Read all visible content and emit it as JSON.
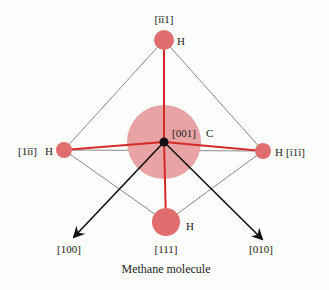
{
  "title": "Methane molecule",
  "colors": {
    "carbon_fill": "#e8a4a4",
    "hydrogen_fill": "#e06e6e",
    "bond": "#d42a2a",
    "axis": "#111111",
    "outline": "#888888"
  },
  "atoms": {
    "carbon": {
      "symbol": "C",
      "direction": "[001]"
    },
    "h_top": {
      "symbol": "H",
      "direction": "[īī1]"
    },
    "h_left": {
      "symbol": "H",
      "direction": "[1īī]"
    },
    "h_right": {
      "symbol": "H",
      "direction": "[ī1ī]"
    },
    "h_bottom": {
      "symbol": "H",
      "direction": "[111]"
    }
  },
  "axes": {
    "x": "[100]",
    "y": "[010]"
  }
}
